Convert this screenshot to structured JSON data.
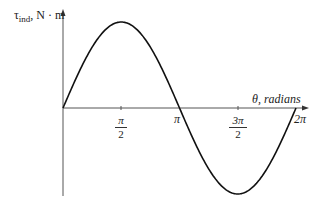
{
  "chart_data": {
    "type": "line",
    "title": "",
    "xlabel": "θ, radians",
    "ylabel": "τind, N·m",
    "xticks": [
      "π/2",
      "π",
      "3π/2",
      "2π"
    ],
    "series": [
      {
        "name": "τind = sin(θ)",
        "function": "sin",
        "x_range": [
          0,
          6.283
        ],
        "amplitude": 1
      }
    ],
    "x": [
      0,
      0.785,
      1.571,
      2.356,
      3.142,
      3.927,
      4.712,
      5.498,
      6.283
    ],
    "values": [
      0,
      0.707,
      1,
      0.707,
      0,
      -0.707,
      -1,
      -0.707,
      0
    ],
    "grid": false,
    "legend": "none"
  },
  "labels": {
    "y_axis_tau": "τ",
    "y_axis_sub": "ind",
    "y_axis_unit": ", N · m",
    "x_axis": "θ, radians",
    "tick_pi_half_num": "π",
    "tick_pi_half_den": "2",
    "tick_pi": "π",
    "tick_3pi_half_num": "3π",
    "tick_3pi_half_den": "2",
    "tick_2pi": "2π"
  }
}
